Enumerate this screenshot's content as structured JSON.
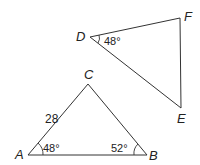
{
  "diagram": {
    "triangle_abc": {
      "vertices": {
        "A": "A",
        "B": "B",
        "C": "C"
      },
      "side_ac_length": "28",
      "angle_a": "48°",
      "angle_b": "52°"
    },
    "triangle_def": {
      "vertices": {
        "D": "D",
        "E": "E",
        "F": "F"
      },
      "angle_d": "48°"
    },
    "colors": {
      "line": "#333333",
      "text": "#222222"
    }
  }
}
